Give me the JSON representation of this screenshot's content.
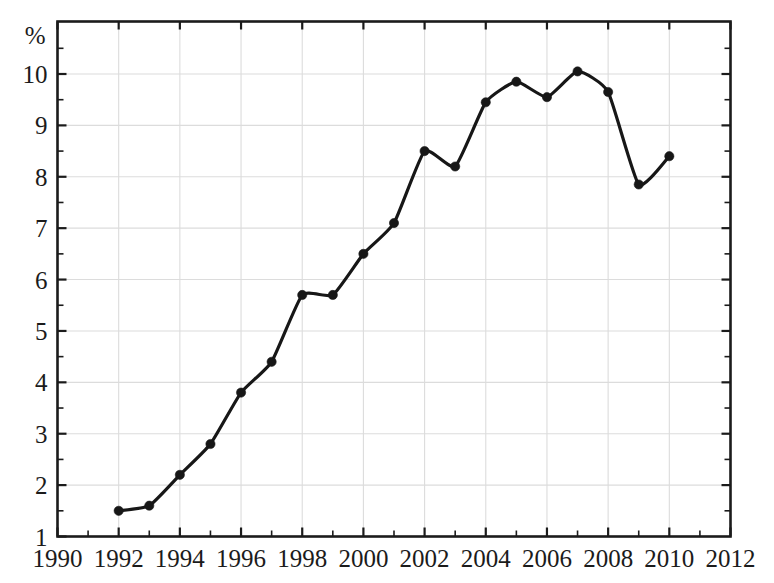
{
  "chart_data": {
    "type": "line",
    "title": "",
    "subtitle": "",
    "xlabel": "",
    "ylabel": "%",
    "unit_label": "%",
    "xlim": [
      1990,
      2012
    ],
    "ylim": [
      1,
      10.6
    ],
    "x_ticks": [
      1990,
      1992,
      1994,
      1996,
      1998,
      2000,
      2002,
      2004,
      2006,
      2008,
      2010,
      2012
    ],
    "x_tick_labels": [
      "1990",
      "1992",
      "1994",
      "1996",
      "1998",
      "2000",
      "2002",
      "2004",
      "2006",
      "2008",
      "2010",
      "2012"
    ],
    "x_minor_tick_step": 1,
    "y_ticks": [
      1,
      2,
      3,
      4,
      5,
      6,
      7,
      8,
      9,
      10
    ],
    "y_tick_labels": [
      "1",
      "2",
      "3",
      "4",
      "5",
      "6",
      "7",
      "8",
      "9",
      "10"
    ],
    "y_minor_tick_step": 0.5,
    "grid": true,
    "grid_color": "#dcdcdc",
    "legend": null,
    "legend_position": "none",
    "x": [
      1992,
      1993,
      1994,
      1995,
      1996,
      1997,
      1998,
      1999,
      2000,
      2001,
      2002,
      2003,
      2004,
      2005,
      2006,
      2007,
      2008,
      2009,
      2010
    ],
    "values": [
      1.5,
      1.6,
      2.2,
      2.8,
      3.8,
      4.4,
      5.7,
      5.7,
      6.5,
      7.1,
      8.5,
      8.2,
      9.45,
      9.85,
      9.55,
      10.05,
      9.65,
      7.85,
      8.4
    ],
    "series": [
      {
        "name": "",
        "color": "#171717",
        "marker": "filled-circle",
        "x": [
          1992,
          1993,
          1994,
          1995,
          1996,
          1997,
          1998,
          1999,
          2000,
          2001,
          2002,
          2003,
          2004,
          2005,
          2006,
          2007,
          2008,
          2009,
          2010
        ],
        "values": [
          1.5,
          1.6,
          2.2,
          2.8,
          3.8,
          4.4,
          5.7,
          5.7,
          6.5,
          7.1,
          8.5,
          8.2,
          9.45,
          9.85,
          9.55,
          10.05,
          9.65,
          7.85,
          8.4
        ]
      }
    ],
    "annotations": []
  },
  "colors": {
    "line": "#171717",
    "marker": "#171717",
    "grid": "#dcdcdc",
    "frame": "#1b1b1b",
    "background": "#ffffff",
    "text": "#1b1b1b"
  }
}
